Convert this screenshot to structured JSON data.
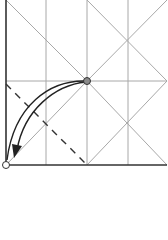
{
  "diagram": {
    "type": "origami-fold-step",
    "colors": {
      "crease": "#a8a8a8",
      "edge": "#333333",
      "arrow": "#222222",
      "point_fill": "#8a8a8a",
      "valley_fold": "#333333"
    },
    "paper": {
      "x1": 6,
      "y1": 0,
      "x2": 167,
      "y2": 165
    },
    "grid_verticals": [
      46,
      87,
      128
    ],
    "grid_horizontals": [
      81
    ],
    "start_point": {
      "x": 87,
      "y": 81
    },
    "end_point": {
      "x": 6,
      "y": 165
    },
    "annotations": []
  }
}
